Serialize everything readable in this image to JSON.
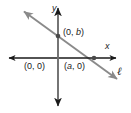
{
  "figure": {
    "type": "coordinate-plane-diagram",
    "colors": {
      "background": "#ffffff",
      "axis": "#1a1a1a",
      "line": "#808080",
      "point": "#555555",
      "text": "#1a1a1a"
    },
    "axes": {
      "x_label": "x",
      "y_label": "y",
      "origin_label": "(0, 0)"
    },
    "line": {
      "name_label": "ℓ",
      "y_intercept_label": "(0, b)",
      "x_intercept_label": "(a, 0)"
    }
  },
  "chart_data": {
    "type": "line",
    "title": "",
    "xlabel": "x",
    "ylabel": "y",
    "grid": false,
    "legend": "none",
    "annotations": [
      {
        "text": "(0, b)",
        "meaning": "y-intercept of line ℓ"
      },
      {
        "text": "(a, 0)",
        "meaning": "x-intercept of line ℓ"
      },
      {
        "text": "(0, 0)",
        "meaning": "origin"
      },
      {
        "text": "ℓ",
        "meaning": "name of the line"
      }
    ],
    "series": [
      {
        "name": "ℓ",
        "points": [
          {
            "x": 0,
            "y": "b"
          },
          {
            "x": "a",
            "y": 0
          }
        ]
      }
    ]
  }
}
